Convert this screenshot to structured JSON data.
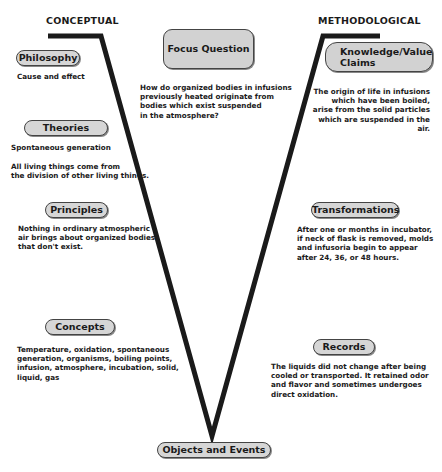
{
  "headings": {
    "left": "CONCEPTUAL",
    "right": "METHODOLOGICAL"
  },
  "focus_question": {
    "label": "Focus Question",
    "text_lines": [
      "How do organized bodies in infusions",
      "previously heated originate from",
      "bodies which exist suspended",
      "in the atmosphere?"
    ]
  },
  "conceptual": {
    "philosophy": {
      "label": "Philosophy",
      "text": "Cause and effect"
    },
    "theories": {
      "label": "Theories",
      "text1": "Spontaneous generation",
      "text2_lines": [
        "All living things come from",
        "the division of other living things."
      ]
    },
    "principles": {
      "label": "Principles",
      "text_lines": [
        "Nothing in ordinary atmospheric",
        "air brings about organized bodies",
        "that don't exist."
      ]
    },
    "concepts": {
      "label": "Concepts",
      "text_lines": [
        "Temperature, oxidation, spontaneous",
        "generation, organisms, boiling points,",
        "infusion, atmosphere, incubation, solid,",
        "liquid, gas"
      ]
    }
  },
  "methodological": {
    "knowledge_value_claims": {
      "label_line1": "Knowledge/Value",
      "label_line2": "Claims",
      "text_lines": [
        "The origin of life in infusions",
        "which have been boiled,",
        "arise from the solid particles",
        "which are suspended in the air."
      ]
    },
    "transformations": {
      "label": "Transformations",
      "text_lines": [
        "After one or months in incubator,",
        "if neck of flask is removed, molds",
        "and infusoria begin to appear",
        "after 24, 36, or 48 hours."
      ]
    },
    "records": {
      "label": "Records",
      "text_lines": [
        "The liquids did not change after being",
        "cooled or transported.  It retained odor",
        "and flavor and sometimes undergoes",
        "direct oxidation."
      ]
    }
  },
  "objects_and_events": {
    "label": "Objects and Events"
  },
  "colors": {
    "line": "#1a1a1a",
    "pill_fill": "#d6d6d6",
    "border": "#444444"
  }
}
